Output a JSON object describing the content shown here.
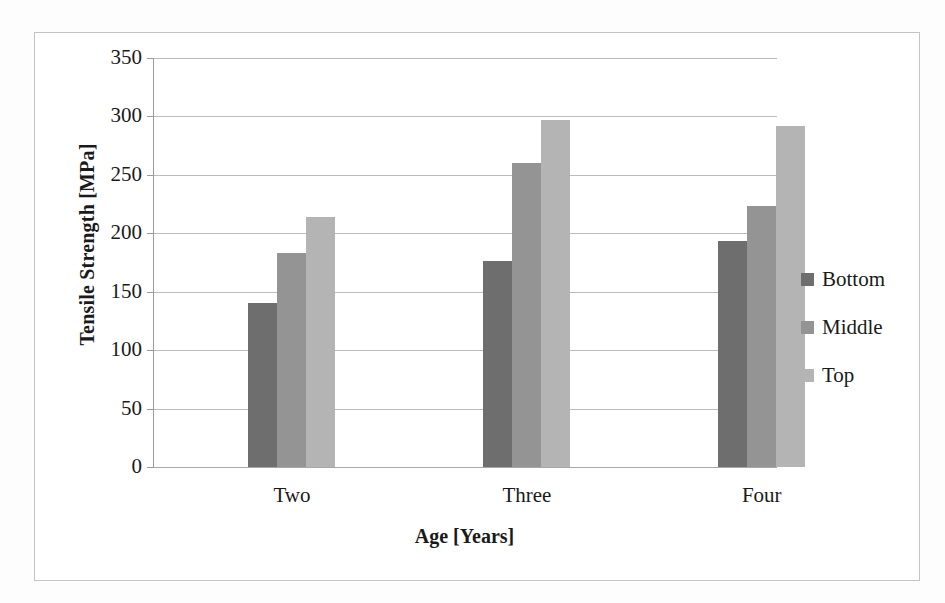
{
  "chart_data": {
    "type": "bar",
    "title": "",
    "xlabel": "Age [Years]",
    "ylabel": "Tensile Strength [MPa]",
    "categories": [
      "Two",
      "Three",
      "Four"
    ],
    "series": [
      {
        "name": "Bottom",
        "color": "#6e6e6e",
        "values": [
          140,
          176,
          193
        ]
      },
      {
        "name": "Middle",
        "color": "#949494",
        "values": [
          183,
          260,
          223
        ]
      },
      {
        "name": "Top",
        "color": "#b4b4b4",
        "values": [
          214,
          297,
          292
        ]
      }
    ],
    "ylim": [
      0,
      350
    ],
    "yticks": [
      0,
      50,
      100,
      150,
      200,
      250,
      300,
      350
    ],
    "ytick_labels": [
      "0",
      "50",
      "100",
      "150",
      "200",
      "250",
      "300",
      "350"
    ],
    "grid": "horizontal",
    "legend_position": "right",
    "gridline_color": "#bcbcbc",
    "axis_color": "#9a9a9a",
    "frame_color": "#c4c4c4",
    "background": "#ffffff"
  }
}
